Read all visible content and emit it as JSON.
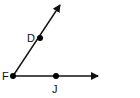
{
  "diagram": {
    "type": "angle",
    "points": [
      {
        "label": "F",
        "x": 13,
        "y": 76,
        "role": "vertex"
      },
      {
        "label": "D",
        "x": 40,
        "y": 38,
        "role": "point-on-ray"
      },
      {
        "label": "J",
        "x": 56,
        "y": 76,
        "role": "point-on-ray"
      }
    ],
    "rays": [
      {
        "from": "F",
        "through": "D",
        "tip": [
          60,
          5
        ]
      },
      {
        "from": "F",
        "through": "J",
        "tip": [
          98,
          76
        ]
      }
    ],
    "colors": {
      "stroke": "#111111",
      "background": "#ffffff"
    }
  }
}
